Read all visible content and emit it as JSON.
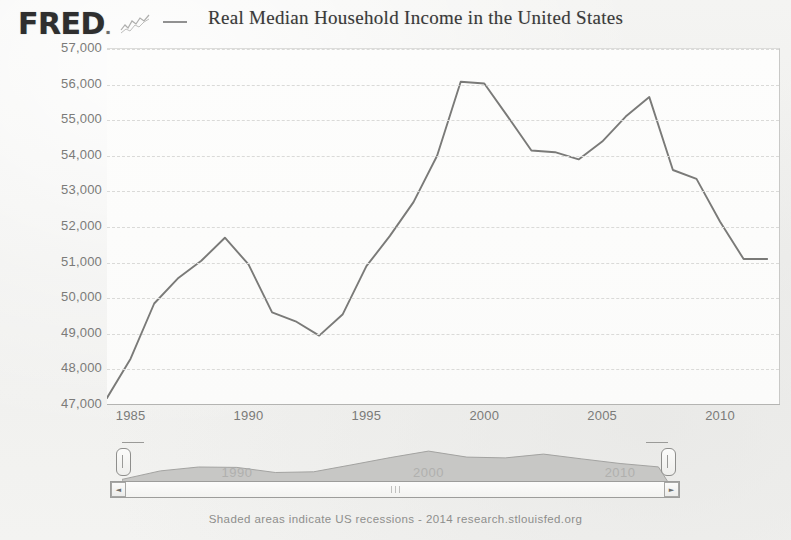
{
  "header": {
    "logo_text": "FRED",
    "logo_suffix": ".",
    "sparkline_icon": "line-chart-icon",
    "legend_marker": "legend-line-icon",
    "title": "Real Median Household Income in the United States"
  },
  "footer": {
    "note": "Shaded areas indicate US recessions - 2014 research.stlouisfed.org"
  },
  "navigator": {
    "year_labels": [
      "1990",
      "2000",
      "2010"
    ],
    "left_handle": "range-handle-left",
    "right_handle": "range-handle-right"
  },
  "scrollbar": {
    "left_arrow": "◄",
    "right_arrow": "►",
    "grip": "scrollbar-grip-icon"
  },
  "chart_data": {
    "type": "line",
    "title": "Real Median Household Income in the United States",
    "xlabel": "",
    "ylabel": "",
    "xlim": [
      1984,
      2012.5
    ],
    "ylim": [
      47000,
      57000
    ],
    "ytick_labels": [
      "57,000",
      "56,000",
      "55,000",
      "54,000",
      "53,000",
      "52,000",
      "51,000",
      "50,000",
      "49,000",
      "48,000",
      "47,000"
    ],
    "yticks": [
      57000,
      56000,
      55000,
      54000,
      53000,
      52000,
      51000,
      50000,
      49000,
      48000,
      47000
    ],
    "xtick_labels": [
      "1985",
      "1990",
      "1995",
      "2000",
      "2005",
      "2010"
    ],
    "xticks": [
      1985,
      1990,
      1995,
      2000,
      2005,
      2010
    ],
    "grid": true,
    "line_color": "#7a7a78",
    "legend": [
      "Real Median Household Income in the United States"
    ],
    "x": [
      1984,
      1985,
      1986,
      1987,
      1988,
      1989,
      1990,
      1991,
      1992,
      1993,
      1994,
      1995,
      1996,
      1997,
      1998,
      1999,
      2000,
      2001,
      2002,
      2003,
      2004,
      2005,
      2006,
      2007,
      2008,
      2009,
      2010,
      2011,
      2012
    ],
    "values": [
      47200,
      48300,
      49850,
      50550,
      51050,
      51700,
      50950,
      49600,
      49350,
      48950,
      49550,
      50900,
      51750,
      52700,
      54000,
      56080,
      56030,
      55100,
      54150,
      54100,
      53900,
      54400,
      55100,
      55650,
      53600,
      53350,
      52150,
      51100,
      51100
    ],
    "annotations": [
      {
        "label": "peak",
        "x": 1999,
        "y": 56080
      },
      {
        "label": "trough",
        "x": 1993,
        "y": 48950
      }
    ],
    "navigator_series": {
      "x": [
        1984,
        1986,
        1988,
        1990,
        1992,
        1994,
        1996,
        1998,
        2000,
        2002,
        2004,
        2006,
        2008,
        2010,
        2012
      ],
      "values": [
        47200,
        49850,
        51050,
        50950,
        49350,
        49550,
        51750,
        54000,
        56030,
        54150,
        53900,
        55100,
        53600,
        52150,
        51100
      ]
    }
  }
}
